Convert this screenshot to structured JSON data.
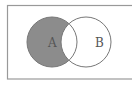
{
  "diagram": {
    "type": "venn",
    "shaded_region": "A only (A \\ B)",
    "sets": [
      {
        "id": "A",
        "label": "A",
        "cx": 52,
        "cy": 42,
        "r": 25
      },
      {
        "id": "B",
        "label": "B",
        "cx": 86,
        "cy": 42,
        "r": 25
      }
    ],
    "universe": {
      "x": 7,
      "y": 5,
      "width": 128,
      "height": 74
    },
    "colors": {
      "shade": "#8c8c8c",
      "stroke": "#777777",
      "border": "#999999",
      "background": "#ffffff"
    }
  }
}
